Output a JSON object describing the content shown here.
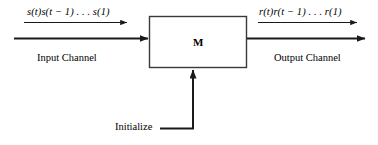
{
  "figure": {
    "type": "block-diagram",
    "background_color": "#ffffff",
    "line_color": "#1a1a1a",
    "box": {
      "label": "M",
      "x": 149,
      "y": 16,
      "width": 98,
      "height": 52,
      "border_color": "#333333",
      "fill": "#ffffff"
    },
    "input": {
      "sequence_label": "s(t)s(t − 1) . . . s(1)",
      "channel_label": "Input Channel"
    },
    "output": {
      "sequence_label": "r(t)r(t − 1) . . . r(1)",
      "channel_label": "Output Channel"
    },
    "control": {
      "label": "Initialize"
    },
    "arrows": [
      {
        "name": "input-sequence-arrow",
        "x1": 24,
        "y1": 22,
        "x2": 128,
        "y2": 22,
        "weight": "thin"
      },
      {
        "name": "input-channel-arrow",
        "x1": 14,
        "y1": 38,
        "x2": 149,
        "y2": 38,
        "weight": "thick"
      },
      {
        "name": "output-sequence-arrow",
        "x1": 258,
        "y1": 22,
        "x2": 358,
        "y2": 22,
        "weight": "thin"
      },
      {
        "name": "output-channel-arrow",
        "x1": 247,
        "y1": 38,
        "x2": 366,
        "y2": 38,
        "weight": "thick"
      },
      {
        "name": "initialize-arrow",
        "x1": 160,
        "y1": 128,
        "x2": 193,
        "y2": 68,
        "weight": "thick"
      }
    ]
  }
}
